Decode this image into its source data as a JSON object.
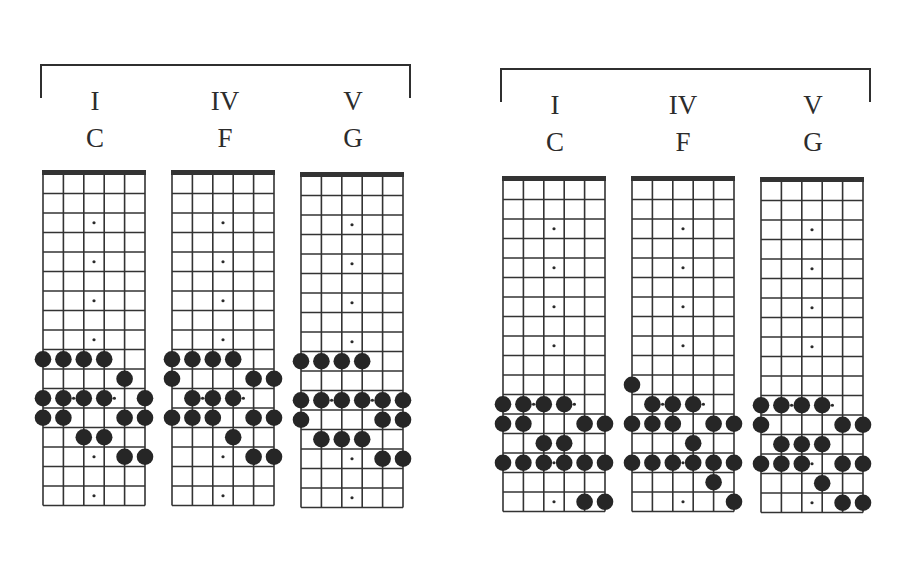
{
  "groups": [
    {
      "name": "left",
      "charts": [
        {
          "roman": "I",
          "chord": "C",
          "notes": [
            [
              10,
              1
            ],
            [
              10,
              2
            ],
            [
              10,
              3
            ],
            [
              10,
              4
            ],
            [
              11,
              5
            ],
            [
              12,
              1
            ],
            [
              12,
              2
            ],
            [
              12,
              3
            ],
            [
              12,
              4
            ],
            [
              12,
              6
            ],
            [
              13,
              1
            ],
            [
              13,
              2
            ],
            [
              13,
              5
            ],
            [
              13,
              6
            ],
            [
              14,
              3
            ],
            [
              14,
              4
            ],
            [
              15,
              5
            ],
            [
              15,
              6
            ]
          ]
        },
        {
          "roman": "IV",
          "chord": "F",
          "notes": [
            [
              10,
              1
            ],
            [
              10,
              2
            ],
            [
              10,
              3
            ],
            [
              10,
              4
            ],
            [
              11,
              1
            ],
            [
              11,
              5
            ],
            [
              11,
              6
            ],
            [
              12,
              2
            ],
            [
              12,
              3
            ],
            [
              12,
              4
            ],
            [
              13,
              1
            ],
            [
              13,
              2
            ],
            [
              13,
              3
            ],
            [
              13,
              5
            ],
            [
              13,
              6
            ],
            [
              14,
              4
            ],
            [
              15,
              5
            ],
            [
              15,
              6
            ]
          ]
        },
        {
          "roman": "V",
          "chord": "G",
          "notes": [
            [
              10,
              1
            ],
            [
              10,
              2
            ],
            [
              10,
              3
            ],
            [
              10,
              4
            ],
            [
              12,
              1
            ],
            [
              12,
              2
            ],
            [
              12,
              3
            ],
            [
              12,
              4
            ],
            [
              12,
              5
            ],
            [
              12,
              6
            ],
            [
              13,
              1
            ],
            [
              13,
              5
            ],
            [
              13,
              6
            ],
            [
              14,
              2
            ],
            [
              14,
              3
            ],
            [
              14,
              4
            ],
            [
              15,
              5
            ],
            [
              15,
              6
            ]
          ]
        }
      ]
    },
    {
      "name": "right",
      "charts": [
        {
          "roman": "I",
          "chord": "C",
          "notes": [
            [
              12,
              1
            ],
            [
              12,
              2
            ],
            [
              12,
              3
            ],
            [
              12,
              4
            ],
            [
              13,
              1
            ],
            [
              13,
              2
            ],
            [
              13,
              5
            ],
            [
              13,
              6
            ],
            [
              14,
              3
            ],
            [
              14,
              4
            ],
            [
              15,
              1
            ],
            [
              15,
              2
            ],
            [
              15,
              3
            ],
            [
              15,
              4
            ],
            [
              15,
              5
            ],
            [
              15,
              6
            ],
            [
              17,
              5
            ],
            [
              17,
              6
            ]
          ]
        },
        {
          "roman": "IV",
          "chord": "F",
          "notes": [
            [
              11,
              1
            ],
            [
              12,
              2
            ],
            [
              12,
              3
            ],
            [
              12,
              4
            ],
            [
              13,
              1
            ],
            [
              13,
              2
            ],
            [
              13,
              3
            ],
            [
              13,
              5
            ],
            [
              13,
              6
            ],
            [
              14,
              4
            ],
            [
              15,
              1
            ],
            [
              15,
              2
            ],
            [
              15,
              3
            ],
            [
              15,
              4
            ],
            [
              15,
              5
            ],
            [
              15,
              6
            ],
            [
              16,
              5
            ],
            [
              17,
              6
            ]
          ]
        },
        {
          "roman": "V",
          "chord": "G",
          "notes": [
            [
              12,
              1
            ],
            [
              12,
              2
            ],
            [
              12,
              3
            ],
            [
              12,
              4
            ],
            [
              13,
              1
            ],
            [
              13,
              5
            ],
            [
              13,
              6
            ],
            [
              14,
              2
            ],
            [
              14,
              3
            ],
            [
              14,
              4
            ],
            [
              15,
              1
            ],
            [
              15,
              2
            ],
            [
              15,
              3
            ],
            [
              15,
              5
            ],
            [
              15,
              6
            ],
            [
              16,
              4
            ],
            [
              17,
              5
            ],
            [
              17,
              6
            ]
          ]
        }
      ]
    }
  ],
  "fretboard": {
    "strings": 6,
    "frets": 17,
    "inlays": [
      3,
      5,
      7,
      9,
      12,
      15,
      17
    ],
    "double_inlay": 12
  },
  "colors": {
    "ink": "#2a2a2a",
    "note": "#262626",
    "grid": "#333333",
    "paper": "#ffffff"
  }
}
